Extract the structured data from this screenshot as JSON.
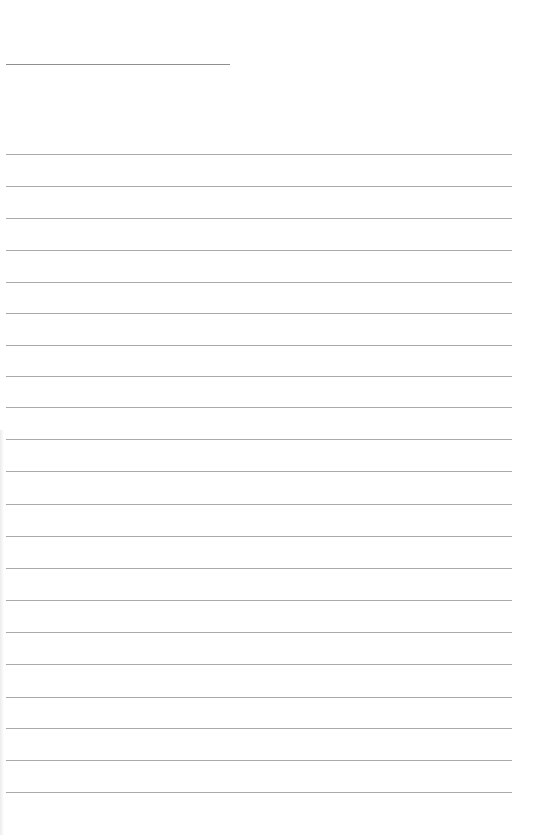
{
  "page": {
    "type": "lined-paper",
    "background_color": "#ffffff",
    "line_color": "#aaaaaa",
    "header_line": {
      "x1": 6,
      "x2": 230,
      "y": 64,
      "color": "#8f8f8f"
    },
    "ruled_lines": {
      "x1": 6,
      "x2": 512,
      "count": 21,
      "y_positions": [
        154,
        186,
        218,
        250,
        282,
        313,
        345,
        376,
        407,
        439,
        471,
        504,
        536,
        568,
        600,
        632,
        664,
        697,
        728,
        760,
        792
      ]
    }
  }
}
